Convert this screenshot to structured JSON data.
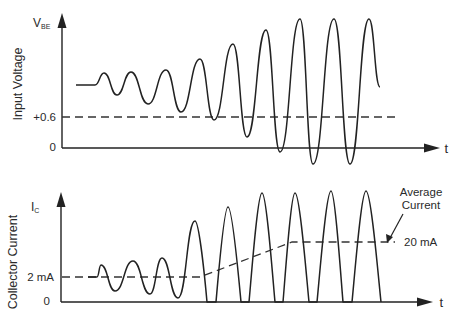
{
  "top_panel": {
    "y_symbol": "V",
    "y_symbol_sub": "BE",
    "y_axis_title": "Input Voltage",
    "x_axis_label": "t",
    "tick_labels": {
      "threshold": "+0.6",
      "zero": "0"
    },
    "waveform_points": [
      [
        76,
        85
      ],
      [
        95,
        85
      ],
      [
        104,
        73
      ],
      [
        117,
        95
      ],
      [
        131,
        72
      ],
      [
        148,
        104
      ],
      [
        166,
        70
      ],
      [
        181,
        112
      ],
      [
        200,
        59
      ],
      [
        214,
        120
      ],
      [
        233,
        44
      ],
      [
        247,
        137
      ],
      [
        266,
        30
      ],
      [
        280,
        152
      ],
      [
        300,
        19
      ],
      [
        313,
        164
      ],
      [
        334,
        19
      ],
      [
        350,
        164
      ],
      [
        369,
        19
      ],
      [
        380,
        87
      ]
    ],
    "threshold_line": {
      "y": 117,
      "x_start": 62,
      "x_end": 396
    }
  },
  "bottom_panel": {
    "y_symbol": "I",
    "y_symbol_sub": "C",
    "y_axis_title": "Collector Current",
    "x_axis_label": "t",
    "tick_labels": {
      "quiescent": "2 mA",
      "zero": "0"
    },
    "annotation": {
      "line1": "Average",
      "line2": "Current",
      "value": "20 mA"
    },
    "waveform_points": [
      [
        88,
        277
      ],
      [
        97,
        277
      ],
      [
        101,
        265
      ],
      [
        115,
        291
      ],
      [
        133,
        261
      ],
      [
        150,
        294
      ],
      [
        162,
        258
      ],
      [
        178,
        298
      ],
      [
        195,
        221
      ],
      [
        207,
        302
      ],
      [
        216,
        302
      ],
      [
        228,
        207
      ],
      [
        241,
        302
      ],
      [
        249,
        302
      ],
      [
        262,
        193
      ],
      [
        275,
        302
      ],
      [
        283,
        302
      ],
      [
        295,
        193
      ],
      [
        309,
        302
      ],
      [
        317,
        302
      ],
      [
        331,
        191
      ],
      [
        343,
        302
      ],
      [
        352,
        302
      ],
      [
        366,
        191
      ],
      [
        381,
        302
      ]
    ],
    "average_line_points": [
      [
        62,
        277
      ],
      [
        200,
        277
      ],
      [
        292,
        242
      ],
      [
        395,
        242
      ]
    ]
  },
  "chart_data": {
    "type": "line",
    "title": "",
    "panels": [
      {
        "ylabel": "Input Voltage (V_BE)",
        "xlabel": "t",
        "y_ticks": [
          "0",
          "+0.6"
        ],
        "series": [
          {
            "name": "V_BE",
            "description": "sinusoid around a DC offset above +0.6 V with growing amplitude; later cycles dip below 0"
          }
        ],
        "reference_lines": [
          {
            "label": "+0.6",
            "style": "dashed"
          }
        ]
      },
      {
        "ylabel": "Collector Current (I_C)",
        "xlabel": "t",
        "y_ticks": [
          "0",
          "2 mA"
        ],
        "series": [
          {
            "name": "I_C",
            "description": "sinusoid about 2 mA growing in amplitude; later cycles clipped at 0 (half-wave pulses)"
          }
        ],
        "reference_lines": [
          {
            "label": "Average Current",
            "from": "2 mA",
            "to": "20 mA",
            "style": "dashed"
          }
        ]
      }
    ]
  }
}
